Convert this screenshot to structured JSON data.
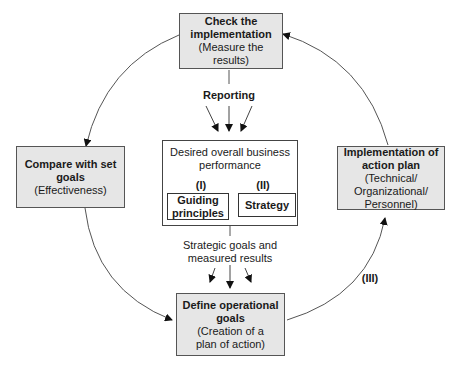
{
  "nodes": {
    "check": {
      "title_l1": "Check the",
      "title_l2": "implementation",
      "sub_l1": "(Measure the",
      "sub_l2": "results)"
    },
    "compare": {
      "title_l1": "Compare with set",
      "title_l2": "goals",
      "sub_l1": "(Effectiveness)"
    },
    "implement": {
      "title_l1": "Implementation of",
      "title_l2": "action plan",
      "sub_l1": "(Technical/",
      "sub_l2": "Organizational/",
      "sub_l3": "Personnel)"
    },
    "define": {
      "title_l1": "Define operational",
      "title_l2": "goals",
      "sub_l1": "(Creation of a",
      "sub_l2": "plan of action)"
    }
  },
  "center": {
    "heading_l1": "Desired overall business",
    "heading_l2": "performance",
    "roman_1": "(I)",
    "roman_2": "(II)",
    "guiding_l1": "Guiding",
    "guiding_l2": "principles",
    "strategy": "Strategy"
  },
  "labels": {
    "reporting": "Reporting",
    "strategic_l1": "Strategic goals and",
    "strategic_l2": "measured results",
    "roman_3": "(III)"
  },
  "colors": {
    "box_fill": "#e6e6e6",
    "line": "#444444"
  }
}
